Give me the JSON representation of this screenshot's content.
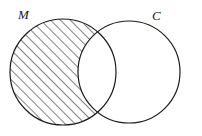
{
  "figure": {
    "kind": "venn-diagram",
    "background_color": "#ffffff",
    "stroke_color": "#1a1a1a",
    "hatch_color": "#1a1a1a",
    "width": 202,
    "height": 136
  },
  "sets": {
    "left": {
      "label": "M",
      "center_x": 63,
      "center_y": 72,
      "radius": 53,
      "shaded": true
    },
    "right": {
      "label": "C",
      "center_x": 129,
      "center_y": 72,
      "radius": 51,
      "shaded": false
    }
  },
  "labels": {
    "left_label": "M",
    "left_label_x": 18,
    "left_label_y": 19,
    "right_label": "C",
    "right_label_x": 152,
    "right_label_y": 20
  },
  "hatching": {
    "angle_degrees": 45,
    "spacing_px": 7,
    "line_width_px": 1
  }
}
